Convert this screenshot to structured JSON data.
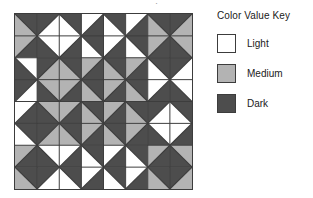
{
  "title_sliver": "·",
  "legend": {
    "title": "Color Value Key",
    "items": [
      {
        "label": "Light",
        "color": "#ffffff",
        "key": "L"
      },
      {
        "label": "Medium",
        "color": "#b3b3b3",
        "key": "M"
      },
      {
        "label": "Dark",
        "color": "#4d4d4d",
        "key": "D"
      }
    ]
  },
  "quilt": {
    "rows": 8,
    "cols": 8,
    "cell_px": 22.25,
    "border_color": "#3c3c3c",
    "palette": {
      "L": "#ffffff",
      "M": "#b3b3b3",
      "D": "#4d4d4d"
    },
    "note": "Each cell is split by one diagonal into two triangles. 'dir' = which diagonal: 'tlbr' splits top-left->bottom-right (a=upper-right tri, b=lower-left tri); 'trbl' splits top-right->bottom-left (a=upper-left tri, b=lower-right tri).",
    "cells": [
      [
        {
          "dir": "tlbr",
          "a": "D",
          "b": "M"
        },
        {
          "dir": "trbl",
          "a": "D",
          "b": "L"
        },
        {
          "dir": "tlbr",
          "a": "D",
          "b": "L"
        },
        {
          "dir": "trbl",
          "a": "L",
          "b": "D"
        },
        {
          "dir": "tlbr",
          "a": "D",
          "b": "L"
        },
        {
          "dir": "trbl",
          "a": "L",
          "b": "D"
        },
        {
          "dir": "tlbr",
          "a": "D",
          "b": "M"
        },
        {
          "dir": "trbl",
          "a": "D",
          "b": "M"
        }
      ],
      [
        {
          "dir": "trbl",
          "a": "M",
          "b": "D"
        },
        {
          "dir": "tlbr",
          "a": "L",
          "b": "D"
        },
        {
          "dir": "trbl",
          "a": "L",
          "b": "D"
        },
        {
          "dir": "tlbr",
          "a": "D",
          "b": "L"
        },
        {
          "dir": "trbl",
          "a": "L",
          "b": "D"
        },
        {
          "dir": "tlbr",
          "a": "D",
          "b": "L"
        },
        {
          "dir": "trbl",
          "a": "M",
          "b": "D"
        },
        {
          "dir": "tlbr",
          "a": "M",
          "b": "D"
        }
      ],
      [
        {
          "dir": "tlbr",
          "a": "L",
          "b": "D"
        },
        {
          "dir": "trbl",
          "a": "D",
          "b": "M"
        },
        {
          "dir": "tlbr",
          "a": "D",
          "b": "M"
        },
        {
          "dir": "trbl",
          "a": "M",
          "b": "D"
        },
        {
          "dir": "tlbr",
          "a": "D",
          "b": "M"
        },
        {
          "dir": "trbl",
          "a": "M",
          "b": "D"
        },
        {
          "dir": "tlbr",
          "a": "D",
          "b": "L"
        },
        {
          "dir": "trbl",
          "a": "D",
          "b": "L"
        }
      ],
      [
        {
          "dir": "trbl",
          "a": "D",
          "b": "L"
        },
        {
          "dir": "tlbr",
          "a": "M",
          "b": "D"
        },
        {
          "dir": "trbl",
          "a": "M",
          "b": "D"
        },
        {
          "dir": "tlbr",
          "a": "D",
          "b": "M"
        },
        {
          "dir": "trbl",
          "a": "M",
          "b": "D"
        },
        {
          "dir": "tlbr",
          "a": "D",
          "b": "M"
        },
        {
          "dir": "trbl",
          "a": "L",
          "b": "D"
        },
        {
          "dir": "tlbr",
          "a": "L",
          "b": "D"
        }
      ],
      [
        {
          "dir": "trbl",
          "a": "L",
          "b": "D"
        },
        {
          "dir": "tlbr",
          "a": "M",
          "b": "D"
        },
        {
          "dir": "trbl",
          "a": "M",
          "b": "D"
        },
        {
          "dir": "tlbr",
          "a": "D",
          "b": "M"
        },
        {
          "dir": "trbl",
          "a": "M",
          "b": "D"
        },
        {
          "dir": "tlbr",
          "a": "D",
          "b": "M"
        },
        {
          "dir": "trbl",
          "a": "D",
          "b": "L"
        },
        {
          "dir": "tlbr",
          "a": "D",
          "b": "L"
        }
      ],
      [
        {
          "dir": "tlbr",
          "a": "D",
          "b": "L"
        },
        {
          "dir": "trbl",
          "a": "D",
          "b": "M"
        },
        {
          "dir": "tlbr",
          "a": "D",
          "b": "M"
        },
        {
          "dir": "trbl",
          "a": "M",
          "b": "D"
        },
        {
          "dir": "tlbr",
          "a": "D",
          "b": "M"
        },
        {
          "dir": "trbl",
          "a": "M",
          "b": "D"
        },
        {
          "dir": "tlbr",
          "a": "L",
          "b": "D"
        },
        {
          "dir": "trbl",
          "a": "L",
          "b": "D"
        }
      ],
      [
        {
          "dir": "trbl",
          "a": "M",
          "b": "D"
        },
        {
          "dir": "tlbr",
          "a": "L",
          "b": "D"
        },
        {
          "dir": "trbl",
          "a": "L",
          "b": "D"
        },
        {
          "dir": "tlbr",
          "a": "D",
          "b": "L"
        },
        {
          "dir": "trbl",
          "a": "L",
          "b": "D"
        },
        {
          "dir": "tlbr",
          "a": "D",
          "b": "L"
        },
        {
          "dir": "trbl",
          "a": "M",
          "b": "D"
        },
        {
          "dir": "tlbr",
          "a": "M",
          "b": "D"
        }
      ],
      [
        {
          "dir": "tlbr",
          "a": "D",
          "b": "M"
        },
        {
          "dir": "trbl",
          "a": "D",
          "b": "L"
        },
        {
          "dir": "tlbr",
          "a": "D",
          "b": "L"
        },
        {
          "dir": "trbl",
          "a": "L",
          "b": "D"
        },
        {
          "dir": "tlbr",
          "a": "D",
          "b": "L"
        },
        {
          "dir": "trbl",
          "a": "L",
          "b": "D"
        },
        {
          "dir": "tlbr",
          "a": "D",
          "b": "M"
        },
        {
          "dir": "trbl",
          "a": "D",
          "b": "M"
        }
      ]
    ]
  }
}
